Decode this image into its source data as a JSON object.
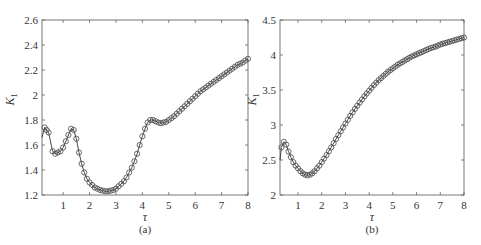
{
  "chart_data": [
    {
      "type": "line",
      "panel_label": "(a)",
      "title": "",
      "xlabel": "τ",
      "ylabel": "K1",
      "ylabel_main": "K",
      "ylabel_sub": "1",
      "xlim": [
        0.2,
        8
      ],
      "ylim": [
        1.2,
        2.6
      ],
      "xticks": [
        1,
        2,
        3,
        4,
        5,
        6,
        7,
        8
      ],
      "yticks": [
        1.2,
        1.4,
        1.6,
        1.8,
        2,
        2.2,
        2.4,
        2.6
      ],
      "ytick_labels": [
        "1.2",
        "1.4",
        "1.6",
        "1.8",
        "2",
        "2.2",
        "2.4",
        "2.6"
      ],
      "grid": false,
      "marker": "circle-open",
      "series": [
        {
          "name": "K1",
          "x": [
            0.2,
            0.3,
            0.45,
            0.6,
            0.7,
            0.8,
            0.9,
            1.0,
            1.1,
            1.2,
            1.3,
            1.4,
            1.5,
            1.6,
            1.7,
            1.8,
            1.9,
            2.0,
            2.1,
            2.2,
            2.3,
            2.4,
            2.5,
            2.6,
            2.7,
            2.8,
            2.9,
            3.0,
            3.1,
            3.2,
            3.3,
            3.4,
            3.5,
            3.6,
            3.7,
            3.8,
            3.9,
            4.0,
            4.1,
            4.2,
            4.3,
            4.4,
            4.5,
            4.6,
            4.7,
            4.8,
            4.9,
            5.0,
            5.2,
            5.4,
            5.6,
            5.8,
            6.0,
            6.2,
            6.4,
            6.6,
            6.8,
            7.0,
            7.2,
            7.4,
            7.6,
            7.8,
            8.0
          ],
          "y": [
            1.66,
            1.74,
            1.7,
            1.55,
            1.53,
            1.54,
            1.55,
            1.58,
            1.63,
            1.68,
            1.73,
            1.72,
            1.65,
            1.54,
            1.45,
            1.38,
            1.33,
            1.3,
            1.28,
            1.26,
            1.25,
            1.24,
            1.235,
            1.23,
            1.23,
            1.235,
            1.24,
            1.25,
            1.27,
            1.29,
            1.31,
            1.34,
            1.38,
            1.42,
            1.47,
            1.53,
            1.6,
            1.67,
            1.73,
            1.78,
            1.8,
            1.8,
            1.79,
            1.78,
            1.775,
            1.78,
            1.785,
            1.8,
            1.83,
            1.87,
            1.91,
            1.95,
            1.99,
            2.03,
            2.06,
            2.09,
            2.12,
            2.15,
            2.18,
            2.21,
            2.24,
            2.26,
            2.29
          ]
        }
      ]
    },
    {
      "type": "line",
      "panel_label": "(b)",
      "title": "",
      "xlabel": "τ",
      "ylabel": "K1",
      "ylabel_main": "K",
      "ylabel_sub": "1",
      "xlim": [
        0.24,
        8
      ],
      "ylim": [
        2,
        4.5
      ],
      "xticks": [
        1,
        2,
        3,
        4,
        5,
        6,
        7,
        8
      ],
      "yticks": [
        2,
        2.5,
        3,
        3.5,
        4,
        4.5
      ],
      "ytick_labels": [
        "2",
        "2.5",
        "3",
        "3.5",
        "4",
        "4.5"
      ],
      "grid": false,
      "marker": "circle-open",
      "series": [
        {
          "name": "K1",
          "x": [
            0.24,
            0.3,
            0.4,
            0.5,
            0.6,
            0.7,
            0.8,
            0.9,
            1.0,
            1.1,
            1.2,
            1.3,
            1.4,
            1.5,
            1.6,
            1.7,
            1.8,
            1.9,
            2.0,
            2.2,
            2.4,
            2.6,
            2.8,
            3.0,
            3.2,
            3.4,
            3.6,
            3.8,
            4.0,
            4.2,
            4.4,
            4.6,
            4.8,
            5.0,
            5.2,
            5.4,
            5.6,
            5.8,
            6.0,
            6.2,
            6.4,
            6.6,
            6.8,
            7.0,
            7.2,
            7.4,
            7.6,
            7.8,
            8.0
          ],
          "y": [
            2.5,
            2.68,
            2.76,
            2.72,
            2.62,
            2.54,
            2.47,
            2.42,
            2.38,
            2.34,
            2.31,
            2.29,
            2.28,
            2.29,
            2.31,
            2.34,
            2.38,
            2.42,
            2.47,
            2.57,
            2.68,
            2.8,
            2.91,
            3.02,
            3.13,
            3.23,
            3.32,
            3.41,
            3.49,
            3.57,
            3.64,
            3.7,
            3.76,
            3.81,
            3.86,
            3.9,
            3.94,
            3.98,
            4.01,
            4.04,
            4.07,
            4.1,
            4.12,
            4.15,
            4.17,
            4.19,
            4.21,
            4.23,
            4.25
          ]
        }
      ]
    }
  ]
}
